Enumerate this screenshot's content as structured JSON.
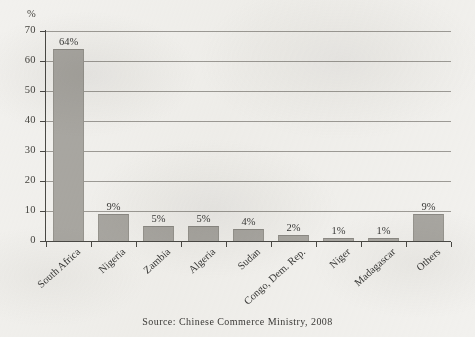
{
  "chart_data": {
    "type": "bar",
    "title": "",
    "subtitle": "",
    "xlabel": "",
    "ylabel": "%",
    "ylim": [
      0,
      70
    ],
    "ytick_values": [
      0,
      10,
      20,
      30,
      40,
      50,
      60,
      70
    ],
    "ytick_labels": [
      "0",
      "10",
      "20",
      "30",
      "40",
      "50",
      "60",
      "70"
    ],
    "grid": true,
    "legend": false,
    "categories": [
      "South Africa",
      "Nigeria",
      "Zambia",
      "Algeria",
      "Sudan",
      "Congo, Dem. Rep.",
      "Niger",
      "Madagascar",
      "Others"
    ],
    "values": [
      64,
      9,
      5,
      5,
      4,
      2,
      1,
      1,
      9
    ],
    "data_labels": [
      "64%",
      "9%",
      "5%",
      "5%",
      "4%",
      "2%",
      "1%",
      "1%",
      "9%"
    ],
    "bar_color": "#a9a7a2",
    "gridline_color": "#8e8c86",
    "axis_color": "#4a4945",
    "background_color": "#f2f1ee",
    "annotations": [
      "Source: Chinese Commerce Ministry, 2008"
    ]
  },
  "axis": {
    "y_unit": "%"
  },
  "footer": {
    "source": "Source: Chinese Commerce Ministry, 2008"
  }
}
